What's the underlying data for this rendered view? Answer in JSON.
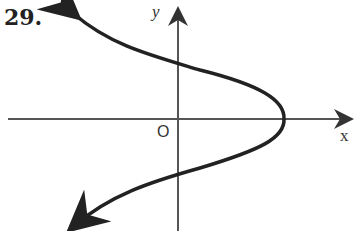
{
  "problem_number": "29.",
  "axes": {
    "x_label": "x",
    "y_label": "y",
    "origin_label": "O"
  },
  "curve": {
    "description": "sideways S-shaped curve opening left, vertex on positive x-axis, arrows at both ends pointing up-left and down-left"
  }
}
